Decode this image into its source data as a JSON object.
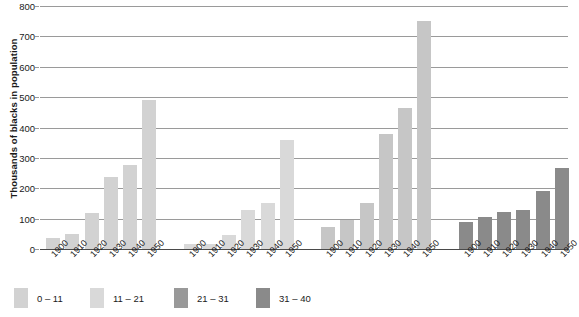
{
  "chart_data": {
    "type": "bar",
    "title": "",
    "xlabel": "",
    "ylabel": "Thousands of blacks in population",
    "ylim": [
      0,
      800
    ],
    "ytick_values": [
      0,
      100,
      200,
      300,
      400,
      500,
      600,
      700,
      800
    ],
    "ytick_labels": [
      "0",
      "100",
      "200",
      "300",
      "400",
      "500",
      "600",
      "700",
      "800"
    ],
    "grid": true,
    "legend_position": "bottom-left",
    "categories": [
      "1900",
      "1910",
      "1920",
      "1930",
      "1940",
      "1950"
    ],
    "series": [
      {
        "name": "0 – 11",
        "color": "#d2d2d2",
        "values": [
          35,
          50,
          118,
          237,
          278,
          489
        ]
      },
      {
        "name": "11 – 21",
        "color": "#d9d9d9",
        "values": [
          15,
          18,
          45,
          130,
          150,
          358
        ]
      },
      {
        "name": "21 – 31",
        "color": "#c6c6c6",
        "values": [
          72,
          95,
          152,
          378,
          465,
          752
        ]
      },
      {
        "name": "31 – 40",
        "color": "#8a8a8a",
        "values": [
          88,
          105,
          122,
          130,
          192,
          268
        ]
      }
    ],
    "legend": [
      {
        "label": "0 – 11",
        "color": "#d2d2d2"
      },
      {
        "label": "11 – 21",
        "color": "#d9d9d9"
      },
      {
        "label": "21 – 31",
        "color": "#999999"
      },
      {
        "label": "31 – 40",
        "color": "#8a8a8a"
      }
    ]
  }
}
